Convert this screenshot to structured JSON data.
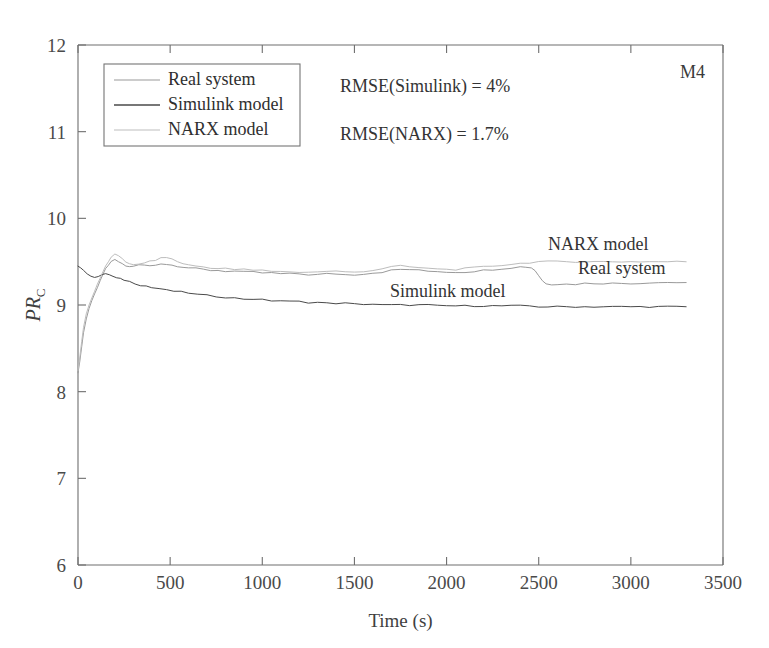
{
  "figure": {
    "corner_label": "M4",
    "background": "#ffffff"
  },
  "annotations": [
    {
      "id": "rmse-simulink",
      "text": "RMSE(Simulink) = 4%",
      "x": 340,
      "y": 92
    },
    {
      "id": "rmse-narx",
      "text": "RMSE(NARX) = 1.7%",
      "x": 340,
      "y": 140
    },
    {
      "id": "narx-model-callout",
      "text": "NARX model",
      "x": 548,
      "y": 250
    },
    {
      "id": "real-system-callout",
      "text": "Real system",
      "x": 578,
      "y": 274
    },
    {
      "id": "simulink-model-callout",
      "text": "Simulink model",
      "x": 390,
      "y": 297
    }
  ],
  "legend": {
    "x": 104,
    "y": 64,
    "width": 196,
    "height": 82,
    "position": "upper-left",
    "entries": [
      {
        "label": "Real system",
        "color": "#9a9a9a"
      },
      {
        "label": "Simulink model",
        "color": "#4a4a4a"
      },
      {
        "label": "NARX model",
        "color": "#bdbdbd"
      }
    ]
  },
  "chart_data": {
    "type": "line",
    "title": "",
    "subtitle": "",
    "xlabel": "Time (s)",
    "ylabel": "PR_C",
    "ylabel_base": "PR",
    "ylabel_subscript": "C",
    "xlim": [
      0,
      3500
    ],
    "ylim": [
      6,
      12
    ],
    "xticks": [
      0,
      500,
      1000,
      1500,
      2000,
      2500,
      3000,
      3500
    ],
    "xtick_labels": [
      "0",
      "500",
      "1000",
      "1500",
      "2000",
      "2500",
      "3000",
      "3500"
    ],
    "yticks": [
      6,
      7,
      8,
      9,
      10,
      11,
      12
    ],
    "ytick_labels": [
      "6",
      "7",
      "8",
      "9",
      "10",
      "11",
      "12"
    ],
    "grid": false,
    "legend_position": "upper-left",
    "annotations_text": [
      "RMSE(Simulink) = 4%",
      "RMSE(NARX) = 1.7%",
      "M4"
    ],
    "series": [
      {
        "name": "Real system",
        "color": "#9a9a9a",
        "width": 1.0,
        "x": [
          0,
          10,
          20,
          30,
          45,
          60,
          75,
          90,
          105,
          120,
          135,
          150,
          165,
          180,
          200,
          220,
          240,
          260,
          280,
          300,
          330,
          360,
          390,
          420,
          450,
          480,
          510,
          540,
          570,
          600,
          640,
          680,
          720,
          760,
          800,
          850,
          900,
          950,
          1000,
          1050,
          1100,
          1150,
          1200,
          1250,
          1300,
          1350,
          1400,
          1450,
          1500,
          1550,
          1600,
          1650,
          1700,
          1750,
          1800,
          1850,
          1900,
          1950,
          2000,
          2050,
          2100,
          2150,
          2200,
          2250,
          2300,
          2350,
          2400,
          2430,
          2460,
          2480,
          2500,
          2520,
          2540,
          2570,
          2600,
          2650,
          2700,
          2750,
          2800,
          2850,
          2900,
          2950,
          3000,
          3050,
          3100,
          3150,
          3200,
          3250,
          3300
        ],
        "y": [
          8.22,
          8.35,
          8.52,
          8.68,
          8.84,
          8.96,
          9.05,
          9.13,
          9.2,
          9.28,
          9.35,
          9.42,
          9.46,
          9.5,
          9.52,
          9.5,
          9.47,
          9.45,
          9.44,
          9.45,
          9.46,
          9.46,
          9.45,
          9.46,
          9.48,
          9.47,
          9.46,
          9.45,
          9.44,
          9.43,
          9.42,
          9.41,
          9.4,
          9.4,
          9.39,
          9.39,
          9.38,
          9.38,
          9.37,
          9.37,
          9.36,
          9.36,
          9.36,
          9.35,
          9.35,
          9.36,
          9.36,
          9.35,
          9.35,
          9.36,
          9.37,
          9.38,
          9.4,
          9.41,
          9.41,
          9.4,
          9.39,
          9.39,
          9.38,
          9.38,
          9.38,
          9.39,
          9.4,
          9.41,
          9.42,
          9.43,
          9.44,
          9.44,
          9.43,
          9.4,
          9.34,
          9.28,
          9.25,
          9.24,
          9.24,
          9.24,
          9.24,
          9.25,
          9.25,
          9.25,
          9.25,
          9.25,
          9.25,
          9.25,
          9.26,
          9.26,
          9.26,
          9.26,
          9.26
        ]
      },
      {
        "name": "Simulink model",
        "color": "#4a4a4a",
        "width": 1.0,
        "x": [
          0,
          15,
          30,
          50,
          70,
          90,
          110,
          130,
          150,
          170,
          190,
          210,
          230,
          250,
          280,
          310,
          340,
          370,
          400,
          440,
          480,
          520,
          560,
          600,
          650,
          700,
          750,
          800,
          850,
          900,
          950,
          1000,
          1050,
          1100,
          1150,
          1200,
          1250,
          1300,
          1350,
          1400,
          1450,
          1500,
          1550,
          1600,
          1650,
          1700,
          1750,
          1800,
          1850,
          1900,
          1950,
          2000,
          2050,
          2100,
          2150,
          2200,
          2250,
          2300,
          2350,
          2400,
          2450,
          2500,
          2550,
          2600,
          2650,
          2700,
          2750,
          2800,
          2850,
          2900,
          2950,
          3000,
          3050,
          3100,
          3150,
          3200,
          3250,
          3300
        ],
        "y": [
          9.45,
          9.43,
          9.4,
          9.36,
          9.33,
          9.32,
          9.33,
          9.35,
          9.36,
          9.35,
          9.33,
          9.31,
          9.3,
          9.29,
          9.27,
          9.25,
          9.23,
          9.22,
          9.2,
          9.19,
          9.17,
          9.16,
          9.15,
          9.14,
          9.12,
          9.11,
          9.1,
          9.09,
          9.08,
          9.07,
          9.07,
          9.06,
          9.05,
          9.05,
          9.04,
          9.04,
          9.03,
          9.03,
          9.02,
          9.02,
          9.02,
          9.01,
          9.01,
          9.01,
          9.0,
          9.0,
          9.0,
          9.0,
          9.0,
          9.0,
          8.99,
          8.99,
          8.99,
          8.99,
          8.99,
          8.99,
          8.99,
          8.99,
          8.99,
          8.99,
          8.99,
          8.98,
          8.98,
          8.98,
          8.98,
          8.98,
          8.98,
          8.98,
          8.98,
          8.98,
          8.98,
          8.98,
          8.98,
          8.98,
          8.98,
          8.98,
          8.98,
          8.98
        ]
      },
      {
        "name": "NARX model",
        "color": "#bdbdbd",
        "width": 1.0,
        "x": [
          0,
          10,
          20,
          30,
          45,
          60,
          75,
          90,
          105,
          120,
          135,
          150,
          165,
          180,
          200,
          220,
          240,
          260,
          280,
          300,
          330,
          360,
          390,
          420,
          450,
          480,
          510,
          540,
          570,
          600,
          640,
          680,
          720,
          760,
          800,
          850,
          900,
          950,
          1000,
          1050,
          1100,
          1150,
          1200,
          1250,
          1300,
          1350,
          1400,
          1450,
          1500,
          1550,
          1600,
          1650,
          1700,
          1750,
          1800,
          1850,
          1900,
          1950,
          2000,
          2050,
          2100,
          2150,
          2200,
          2250,
          2300,
          2350,
          2400,
          2450,
          2500,
          2550,
          2600,
          2650,
          2700,
          2750,
          2800,
          2850,
          2900,
          2950,
          3000,
          3050,
          3100,
          3150,
          3200,
          3250,
          3300
        ],
        "y": [
          8.24,
          8.4,
          8.58,
          8.74,
          8.9,
          9.0,
          9.08,
          9.16,
          9.24,
          9.31,
          9.38,
          9.45,
          9.5,
          9.55,
          9.58,
          9.57,
          9.54,
          9.5,
          9.47,
          9.46,
          9.47,
          9.49,
          9.5,
          9.52,
          9.54,
          9.55,
          9.53,
          9.5,
          9.48,
          9.46,
          9.45,
          9.44,
          9.43,
          9.42,
          9.42,
          9.41,
          9.41,
          9.4,
          9.4,
          9.39,
          9.39,
          9.38,
          9.38,
          9.38,
          9.38,
          9.39,
          9.39,
          9.38,
          9.38,
          9.39,
          9.4,
          9.42,
          9.44,
          9.45,
          9.44,
          9.43,
          9.42,
          9.42,
          9.41,
          9.41,
          9.42,
          9.43,
          9.44,
          9.45,
          9.46,
          9.47,
          9.48,
          9.49,
          9.5,
          9.5,
          9.5,
          9.5,
          9.5,
          9.5,
          9.5,
          9.5,
          9.5,
          9.5,
          9.5,
          9.5,
          9.5,
          9.5,
          9.5,
          9.5,
          9.5
        ]
      }
    ]
  }
}
